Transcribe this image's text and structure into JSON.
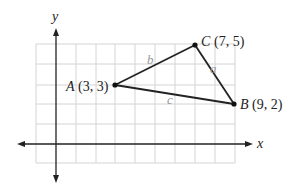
{
  "axes": {
    "x_label": "x",
    "y_label": "y",
    "grid": {
      "x_min": -1,
      "x_max": 9,
      "y_min": -1,
      "y_max": 5,
      "step": 1
    }
  },
  "points": [
    {
      "name": "A",
      "coords": "(3, 3)",
      "x": 3,
      "y": 3
    },
    {
      "name": "B",
      "coords": "(9, 2)",
      "x": 9,
      "y": 2
    },
    {
      "name": "C",
      "coords": "(7, 5)",
      "x": 7,
      "y": 5
    }
  ],
  "sides": [
    {
      "name": "a",
      "from": "B",
      "to": "C"
    },
    {
      "name": "b",
      "from": "A",
      "to": "C"
    },
    {
      "name": "c",
      "from": "A",
      "to": "B"
    }
  ]
}
